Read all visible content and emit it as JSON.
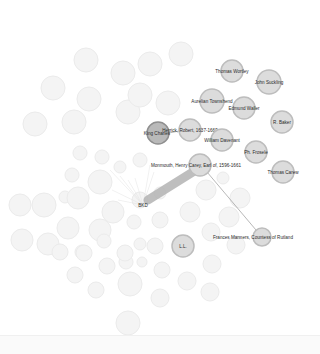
{
  "graph": {
    "type": "network",
    "highlighted_nodes": [
      {
        "id": "thomas-wortley",
        "label": "Thomas Wortley",
        "x": 232,
        "y": 71,
        "r": 11
      },
      {
        "id": "john-suckling",
        "label": "John Suckling",
        "x": 269,
        "y": 82,
        "r": 12
      },
      {
        "id": "aurelian-townshend",
        "label": "Aurelian Townshend",
        "x": 212,
        "y": 101,
        "r": 12
      },
      {
        "id": "edmund-waller",
        "label": "Edmund Waller",
        "x": 244,
        "y": 108,
        "r": 11
      },
      {
        "id": "r-baker",
        "label": "R. Baker",
        "x": 282,
        "y": 122,
        "r": 11
      },
      {
        "id": "king-charles",
        "label": "King Charles",
        "x": 158,
        "y": 133,
        "r": 11
      },
      {
        "id": "herrick-robert",
        "label": "Herrick, Robert, 1637-1669",
        "x": 190,
        "y": 130,
        "r": 11
      },
      {
        "id": "william-davenant",
        "label": "William Davenant",
        "x": 222,
        "y": 140,
        "r": 11
      },
      {
        "id": "ph-fresele",
        "label": "Ph. Frosele",
        "x": 256,
        "y": 152,
        "r": 11
      },
      {
        "id": "thomas-carew",
        "label": "Thomas Carew",
        "x": 283,
        "y": 172,
        "r": 11
      },
      {
        "id": "monmouth",
        "label": "Monmouth, Henry Carey, Earl of, 1596-1661",
        "x": 200,
        "y": 165,
        "r": 11
      },
      {
        "id": "ll",
        "label": "L.L.",
        "x": 183,
        "y": 246,
        "r": 11
      },
      {
        "id": "frances-manners",
        "label": "Frances Manners, Countess of Rutland",
        "x": 262,
        "y": 237,
        "r": 9
      }
    ],
    "focus_node": {
      "id": "king-charles",
      "label": "King Charles"
    },
    "focus_small_label": "BKD",
    "thick_edge": {
      "from": "monmouth",
      "to": "BKD"
    },
    "label_extra": {
      "monmouth_suffix": "Monmouth, Henry Carey, Earl of, 1596-1661"
    }
  }
}
